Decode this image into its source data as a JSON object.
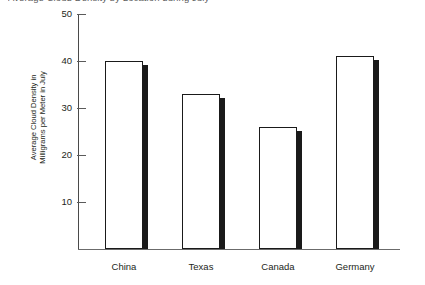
{
  "chart_data": {
    "type": "bar",
    "title": "Average Cloud Density by Location during July",
    "categories": [
      "China",
      "Texas",
      "Canada",
      "Germany"
    ],
    "values": [
      40,
      33,
      26,
      41
    ],
    "xlabel": "",
    "ylabel": "Average Cloud Density in Milligrams per Meter in July",
    "ylabel_line1": "Average Cloud Density in",
    "ylabel_line2": "Milligrams per Meter in July",
    "ylim": [
      0,
      50
    ],
    "yticks": [
      10,
      20,
      30,
      40,
      50
    ],
    "ytick_labels": [
      "10",
      "20",
      "30",
      "40",
      "50"
    ],
    "grid": false,
    "legend": false,
    "bar_style": {
      "fill": "#ffffff",
      "outline": "#1a1a1a",
      "shadow": "#1a1a1a"
    },
    "axis_color": "#4a4a4a",
    "text_color": "#231f20"
  }
}
